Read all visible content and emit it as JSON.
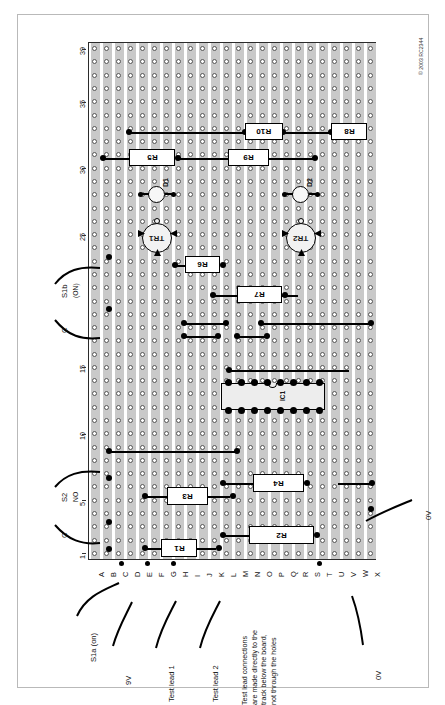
{
  "figure": {
    "type": "stripboard-layout-diagram",
    "copyright": "© 2003 RC2344",
    "board": {
      "rows_letters": [
        "A",
        "B",
        "C",
        "D",
        "E",
        "F",
        "G",
        "H",
        "I",
        "J",
        "K",
        "L",
        "M",
        "N",
        "O",
        "P",
        "Q",
        "R",
        "S",
        "T",
        "U",
        "V",
        "W",
        "X"
      ],
      "column_count": 39,
      "column_ticks": [
        "1",
        "5",
        "10",
        "15",
        "25",
        "30",
        "35",
        "39"
      ]
    },
    "components": {
      "resistors": [
        {
          "name": "R1"
        },
        {
          "name": "R2"
        },
        {
          "name": "R3"
        },
        {
          "name": "R4"
        },
        {
          "name": "R5"
        },
        {
          "name": "R6"
        },
        {
          "name": "R7"
        },
        {
          "name": "R8"
        },
        {
          "name": "R9"
        },
        {
          "name": "R10"
        }
      ],
      "transistors": [
        {
          "name": "TR1"
        },
        {
          "name": "TR2"
        }
      ],
      "diodes": [
        {
          "name": "D1"
        },
        {
          "name": "D2"
        }
      ],
      "ics": [
        {
          "name": "IC1"
        }
      ]
    },
    "connection_labels": {
      "s1a": "S1a (on)",
      "s1b": "S1b",
      "s1b_on": "(ON)",
      "s1b_c": "C",
      "s2": "S2",
      "s2_no": "NO",
      "s2_c": "C",
      "supply_9v": "9V",
      "test_lead_1": "Test lead 1",
      "test_lead_2": "Test lead 2",
      "ov_left": "0V",
      "ov_right": "0V"
    },
    "note": "Test lead connections\nare made directly to the\ntrack below the board,\nnot through the holes"
  },
  "colors": {
    "strip": "#c9c9c9",
    "hole_fill": "#ffffff",
    "wire": "#000000",
    "board_outline": "#2b2b2b",
    "page_border": "#b9b9b9"
  }
}
